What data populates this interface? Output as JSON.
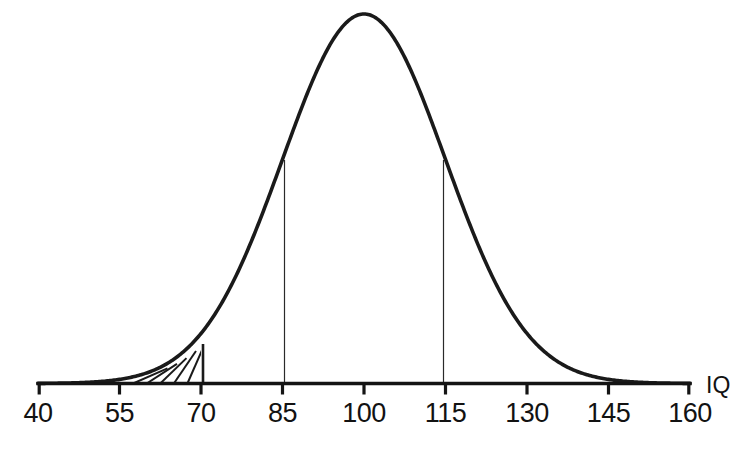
{
  "figure": {
    "axis_title": "IQ",
    "caption_partial": ""
  },
  "chart_data": {
    "type": "line",
    "title": "",
    "subtitle": "",
    "xlabel": "IQ",
    "ylabel": "",
    "grid": false,
    "legend": null,
    "xlim": [
      40,
      160
    ],
    "ylim": [
      0,
      1
    ],
    "distribution": {
      "name": "normal",
      "mean": 100,
      "sd": 15,
      "peak_x": 100
    },
    "xticks": [
      40,
      55,
      70,
      85,
      100,
      115,
      130,
      145,
      160
    ],
    "xtick_labels": [
      "40",
      "55",
      "70",
      "85",
      "100",
      "115",
      "130",
      "145",
      "160"
    ],
    "series": [
      {
        "name": "IQ normal density",
        "x": [
          40,
          45,
          50,
          55,
          60,
          65,
          70,
          75,
          80,
          85,
          90,
          95,
          100,
          105,
          110,
          115,
          120,
          125,
          130,
          135,
          140,
          145,
          150,
          155,
          160
        ],
        "values": [
          0.0,
          0.001,
          0.004,
          0.011,
          0.029,
          0.065,
          0.135,
          0.249,
          0.411,
          0.607,
          0.801,
          0.946,
          1.0,
          0.946,
          0.801,
          0.607,
          0.411,
          0.249,
          0.135,
          0.065,
          0.029,
          0.011,
          0.004,
          0.001,
          0.0
        ]
      }
    ],
    "annotations": [
      {
        "kind": "vertical-line",
        "x": 85,
        "label": "85",
        "from_y": 0,
        "to_y": 0.607
      },
      {
        "kind": "vertical-line",
        "x": 115,
        "label": "115",
        "from_y": 0,
        "to_y": 0.607
      },
      {
        "kind": "vertical-line",
        "x": 70,
        "label": "70",
        "from_y": 0,
        "to_y": 0.135,
        "weight": "bold"
      },
      {
        "kind": "hatched-region",
        "x_from": 55,
        "x_to": 70,
        "hatch": "diagonal",
        "hatch_line_count": 5,
        "description": "shaded left tail below IQ 70"
      }
    ]
  },
  "ticks": [
    {
      "value": 40,
      "label": "40",
      "px": 38
    },
    {
      "value": 55,
      "label": "55",
      "px": 119.5
    },
    {
      "value": 70,
      "label": "70",
      "px": 201
    },
    {
      "value": 85,
      "label": "85",
      "px": 282.5
    },
    {
      "value": 100,
      "label": "100",
      "px": 364
    },
    {
      "value": 115,
      "label": "115",
      "px": 445.5
    },
    {
      "value": 130,
      "label": "130",
      "px": 527
    },
    {
      "value": 145,
      "label": "145",
      "px": 608.5
    },
    {
      "value": 160,
      "label": "160",
      "px": 690
    }
  ],
  "colors": {
    "curve": "#1a1a1a",
    "axis": "#141414",
    "hatch": "#1a1a1a",
    "background": "#ffffff",
    "text": "#121212"
  }
}
